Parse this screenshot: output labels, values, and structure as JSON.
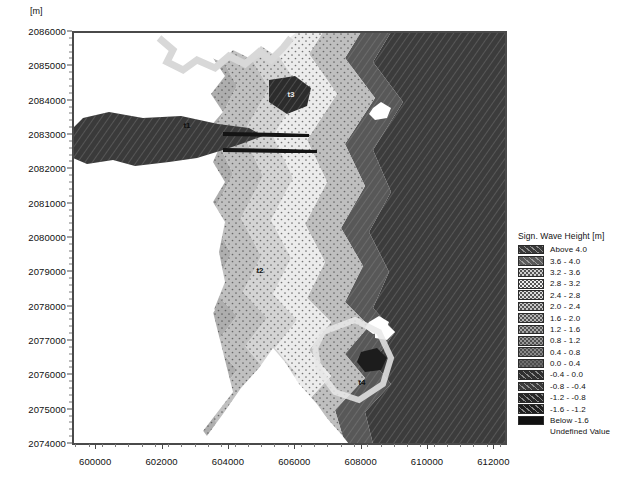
{
  "axes": {
    "unit_label": "[m]",
    "y_ticks": [
      "2086000",
      "2085000",
      "2084000",
      "2083000",
      "2082000",
      "2081000",
      "2080000",
      "2079000",
      "2078000",
      "2077000",
      "2076000",
      "2075000",
      "2074000"
    ],
    "x_ticks": [
      "600000",
      "602000",
      "604000",
      "606000",
      "608000",
      "610000",
      "612000"
    ],
    "y_min": 2074000,
    "y_max": 2086000,
    "x_min": 599300,
    "x_max": 612350
  },
  "stations": [
    {
      "id": "t1",
      "label": "t1",
      "x": 186,
      "y": 124
    },
    {
      "id": "t2",
      "label": "t2",
      "x": 259,
      "y": 269
    },
    {
      "id": "t3",
      "label": "t3",
      "x": 290,
      "y": 93
    },
    {
      "id": "t4",
      "label": "t4",
      "x": 361,
      "y": 381
    }
  ],
  "legend": {
    "title": "Sign. Wave Height [m]",
    "entries": [
      {
        "label": "Above  4.0",
        "color": "#3a3a3a",
        "pattern": "hatch"
      },
      {
        "label": "3.6 -  4.0",
        "color": "#5a5a5a",
        "pattern": "hatch"
      },
      {
        "label": "3.2 -  3.6",
        "color": "#cfcfcf",
        "pattern": "dots"
      },
      {
        "label": "2.8 -  3.2",
        "color": "#efefef",
        "pattern": "dots"
      },
      {
        "label": "2.4 -  2.8",
        "color": "#dcdcdc",
        "pattern": "dots"
      },
      {
        "label": "2.0 -  2.4",
        "color": "#c6c6c6",
        "pattern": "dots"
      },
      {
        "label": "1.6 -  2.0",
        "color": "#b4b4b4",
        "pattern": "dots"
      },
      {
        "label": "1.2 -  1.6",
        "color": "#a6a6a6",
        "pattern": "dots"
      },
      {
        "label": "0.8 -  1.2",
        "color": "#9a9a9a",
        "pattern": "dots"
      },
      {
        "label": "0.4 -  0.8",
        "color": "#8a8a8a",
        "pattern": "dots"
      },
      {
        "label": "0.0 -  0.4",
        "color": "#6e6e6e",
        "pattern": "dots"
      },
      {
        "label": "-0.4 -  0.0",
        "color": "#303030",
        "pattern": "hatch"
      },
      {
        "label": "-0.8 - -0.4",
        "color": "#3c3c3c",
        "pattern": "hatch"
      },
      {
        "label": "-1.2 - -0.8",
        "color": "#282828",
        "pattern": "hatch"
      },
      {
        "label": "-1.6 - -1.2",
        "color": "#1e1e1e",
        "pattern": "hatch"
      },
      {
        "label": "Below -1.6",
        "color": "#101010",
        "pattern": "solid"
      },
      {
        "label": "Undefined Value",
        "color": "#ffffff",
        "pattern": "none"
      }
    ]
  },
  "chart_data": {
    "type": "heatmap",
    "title": "Sign. Wave Height [m]",
    "xlabel": "",
    "ylabel": "",
    "axis_unit": "[m]",
    "xlim": [
      599300,
      612350
    ],
    "ylim": [
      2074000,
      2086000
    ],
    "xticks": [
      600000,
      602000,
      604000,
      606000,
      608000,
      610000,
      612000
    ],
    "yticks": [
      2074000,
      2075000,
      2076000,
      2077000,
      2078000,
      2079000,
      2080000,
      2081000,
      2082000,
      2083000,
      2084000,
      2085000,
      2086000
    ],
    "grid": false,
    "legend_position": "right",
    "colorbar_bins": [
      {
        "range": "Above 4.0",
        "min": 4.0,
        "max": null
      },
      {
        "range": "3.6 - 4.0",
        "min": 3.6,
        "max": 4.0
      },
      {
        "range": "3.2 - 3.6",
        "min": 3.2,
        "max": 3.6
      },
      {
        "range": "2.8 - 3.2",
        "min": 2.8,
        "max": 3.2
      },
      {
        "range": "2.4 - 2.8",
        "min": 2.4,
        "max": 2.8
      },
      {
        "range": "2.0 - 2.4",
        "min": 2.0,
        "max": 2.4
      },
      {
        "range": "1.6 - 2.0",
        "min": 1.6,
        "max": 2.0
      },
      {
        "range": "1.2 - 1.6",
        "min": 1.2,
        "max": 1.6
      },
      {
        "range": "0.8 - 1.2",
        "min": 0.8,
        "max": 1.2
      },
      {
        "range": "0.4 - 0.8",
        "min": 0.4,
        "max": 0.8
      },
      {
        "range": "0.0 - 0.4",
        "min": 0.0,
        "max": 0.4
      },
      {
        "range": "-0.4 - 0.0",
        "min": -0.4,
        "max": 0.0
      },
      {
        "range": "-0.8 - -0.4",
        "min": -0.8,
        "max": -0.4
      },
      {
        "range": "-1.2 - -0.8",
        "min": -1.2,
        "max": -0.8
      },
      {
        "range": "-1.6 - -1.2",
        "min": -1.6,
        "max": -1.2
      },
      {
        "range": "Below -1.6",
        "min": null,
        "max": -1.6
      }
    ],
    "annotations": [
      {
        "text": "t1",
        "x": 603500,
        "y": 2083200
      },
      {
        "text": "t2",
        "x": 605700,
        "y": 2078900
      },
      {
        "text": "t3",
        "x": 606600,
        "y": 2084000
      },
      {
        "text": "t4",
        "x": 608700,
        "y": 2075600
      }
    ]
  }
}
